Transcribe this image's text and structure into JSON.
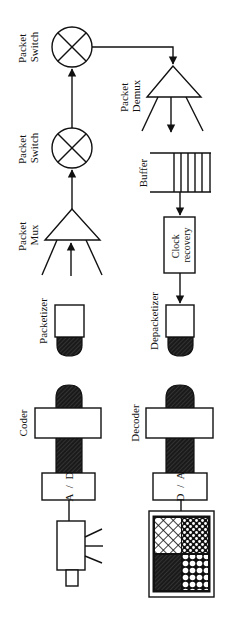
{
  "diagram": {
    "colors": {
      "ink": "#111111",
      "background": "#ffffff"
    },
    "labels": {
      "packet_switch_top": [
        "Packet",
        "Switch"
      ],
      "packet_switch_bottom": [
        "Packet",
        "Switch"
      ],
      "packet_mux": [
        "Packet",
        "Mux"
      ],
      "packet_demux": [
        "Packet",
        "Demux"
      ],
      "buffer": "Buffer",
      "clock_recovery": [
        "Clock",
        "recovery"
      ],
      "packetizer": "Packetizer",
      "depacketizer": "Depacketizer",
      "coder": "Coder",
      "decoder": "Decoder",
      "ad_converter": [
        "A",
        "/",
        "D"
      ],
      "da_converter": [
        "D",
        "/",
        "A"
      ]
    },
    "icons": {
      "switch": "circle-x-icon",
      "mux": "triangle-mux-icon",
      "demux": "triangle-demux-icon",
      "buffer": "queue-buffer-icon",
      "camera": "camera-icon",
      "monitor": "monitor-icon"
    }
  }
}
